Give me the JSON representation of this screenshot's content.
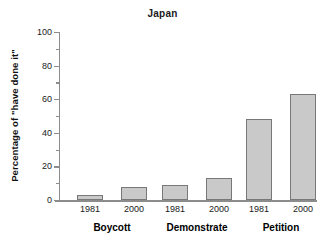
{
  "chart_data": {
    "type": "bar",
    "title": "Japan",
    "xlabel": "",
    "ylabel": "Percentage of \"have done it\"",
    "ylim": [
      0,
      100
    ],
    "yticks": [
      0,
      20,
      40,
      60,
      80,
      100
    ],
    "ytick_labels": [
      "0",
      "20",
      "40",
      "60",
      "80",
      "100"
    ],
    "yminor_ticks": [
      10,
      30,
      50,
      70,
      90
    ],
    "grid": false,
    "legend": "none",
    "categories": [
      "Boycott",
      "Demonstrate",
      "Petition"
    ],
    "series": [
      {
        "name": "1981",
        "values": [
          3,
          9,
          48
        ]
      },
      {
        "name": "2000",
        "values": [
          8,
          13,
          63
        ]
      }
    ],
    "bars": [
      {
        "group": "Boycott",
        "year": "1981",
        "value": 3
      },
      {
        "group": "Boycott",
        "year": "2000",
        "value": 8
      },
      {
        "group": "Demonstrate",
        "year": "1981",
        "value": 9
      },
      {
        "group": "Demonstrate",
        "year": "2000",
        "value": 13
      },
      {
        "group": "Petition",
        "year": "1981",
        "value": 48
      },
      {
        "group": "Petition",
        "year": "2000",
        "value": 63
      }
    ],
    "colors": {
      "bar_fill": "#c9c9c9",
      "bar_edge": "#787878",
      "axis": "#8c8c8c",
      "text": "#1a1a1a",
      "background": "#ffffff"
    }
  }
}
